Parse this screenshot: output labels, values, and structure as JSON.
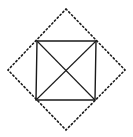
{
  "diagram": {
    "colors": {
      "stroke": "#1a1a1a",
      "background": "#ffffff"
    },
    "square": {
      "corners": [
        [
          37,
          41
        ],
        [
          96,
          41
        ],
        [
          95,
          100
        ],
        [
          36,
          100
        ]
      ]
    },
    "diagonals": [
      [
        [
          37,
          41
        ],
        [
          95,
          100
        ]
      ],
      [
        [
          96,
          41
        ],
        [
          36,
          100
        ]
      ]
    ],
    "diamond": {
      "style": "dotted",
      "vertices": [
        [
          66,
          9
        ],
        [
          125,
          70
        ],
        [
          66,
          130
        ],
        [
          8,
          70
        ]
      ]
    },
    "center": [
      66,
      70
    ]
  }
}
